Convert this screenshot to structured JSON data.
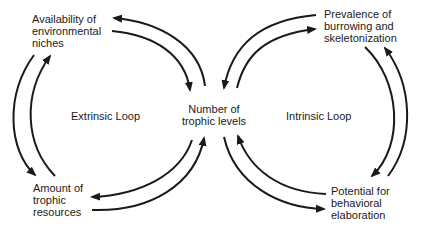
{
  "diagram": {
    "nodes": {
      "top_left": [
        "Availability of",
        "environmental",
        "niches"
      ],
      "bottom_left": [
        "Amount of",
        "trophic",
        "resources"
      ],
      "center": [
        "Number of",
        "trophic levels"
      ],
      "top_right": [
        "Prevalence of",
        "burrowing and",
        "skeletonization"
      ],
      "bottom_right": [
        "Potential for",
        "behavioral",
        "elaboration"
      ]
    },
    "loops": {
      "left": "Extrinsic Loop",
      "right": "Intrinsic Loop"
    },
    "edges": [
      {
        "from": "Availability of environmental niches",
        "to": "Number of trophic levels"
      },
      {
        "from": "Number of trophic levels",
        "to": "Availability of environmental niches"
      },
      {
        "from": "Availability of environmental niches",
        "to": "Amount of trophic resources"
      },
      {
        "from": "Amount of trophic resources",
        "to": "Availability of environmental niches"
      },
      {
        "from": "Amount of trophic resources",
        "to": "Number of trophic levels"
      },
      {
        "from": "Number of trophic levels",
        "to": "Amount of trophic resources"
      },
      {
        "from": "Prevalence of burrowing and skeletonization",
        "to": "Number of trophic levels"
      },
      {
        "from": "Number of trophic levels",
        "to": "Prevalence of burrowing and skeletonization"
      },
      {
        "from": "Prevalence of burrowing and skeletonization",
        "to": "Potential for behavioral elaboration"
      },
      {
        "from": "Potential for behavioral elaboration",
        "to": "Prevalence of burrowing and skeletonization"
      },
      {
        "from": "Potential for behavioral elaboration",
        "to": "Number of trophic levels"
      },
      {
        "from": "Number of trophic levels",
        "to": "Potential for behavioral elaboration"
      }
    ],
    "colors": {
      "ink": "#1a1a1a",
      "background": "#ffffff"
    }
  }
}
